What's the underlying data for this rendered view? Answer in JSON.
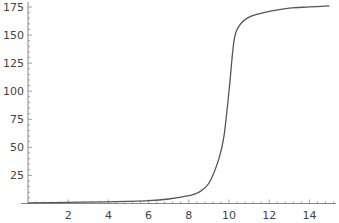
{
  "chart_data": {
    "type": "line",
    "title": "",
    "xlabel": "",
    "ylabel": "",
    "xlim": [
      0,
      15
    ],
    "ylim": [
      0,
      178
    ],
    "x_ticks": [
      2,
      4,
      6,
      8,
      10,
      12,
      14
    ],
    "y_ticks": [
      25,
      50,
      75,
      100,
      125,
      150,
      175
    ],
    "grid": false,
    "legend": null,
    "series": [
      {
        "name": "curve",
        "color": "#555555",
        "x": [
          0,
          2,
          4,
          6,
          7,
          8,
          8.5,
          9,
          9.5,
          9.75,
          10,
          10.25,
          10.5,
          11,
          12,
          13,
          14,
          15
        ],
        "y": [
          0.5,
          1,
          1.5,
          2.5,
          4,
          7,
          10,
          18,
          40,
          60,
          100,
          145,
          158,
          166,
          171,
          174,
          175,
          176
        ]
      }
    ]
  },
  "colors": {
    "axis": "#888888",
    "line": "#555555",
    "label": "#444444"
  }
}
